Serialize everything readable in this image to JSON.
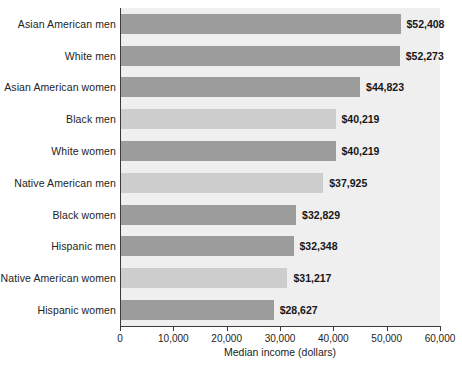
{
  "chart_data": {
    "type": "bar",
    "orientation": "horizontal",
    "title": "",
    "xlabel": "Median income (dollars)",
    "ylabel": "",
    "xlim": [
      0,
      60000
    ],
    "grid": false,
    "legend": false,
    "categories": [
      "Asian American men",
      "White men",
      "Asian American women",
      "Black men",
      "White women",
      "Native American men",
      "Black women",
      "Hispanic men",
      "Native American women",
      "Hispanic women"
    ],
    "values": [
      52408,
      52273,
      44823,
      40219,
      40219,
      37925,
      32829,
      32348,
      31217,
      28627
    ],
    "value_labels": [
      "$52,408",
      "$52,273",
      "$44,823",
      "$40,219",
      "$40,219",
      "$37,925",
      "$32,829",
      "$32,348",
      "$31,217",
      "$28,627"
    ],
    "bar_shades": [
      "dark",
      "dark",
      "dark",
      "light",
      "dark",
      "light",
      "dark",
      "dark",
      "light",
      "dark"
    ],
    "xticks": [
      0,
      10000,
      20000,
      30000,
      40000,
      50000,
      60000
    ],
    "xtick_labels": [
      "0",
      "10,000",
      "20,000",
      "30,000",
      "40,000",
      "50,000",
      "60,000"
    ],
    "colors": {
      "bar_dark": "#9c9c9c",
      "bar_light": "#cdcdcd",
      "plot_background": "#efefef",
      "axis": "#3b3b3b",
      "text": "#232323"
    }
  }
}
